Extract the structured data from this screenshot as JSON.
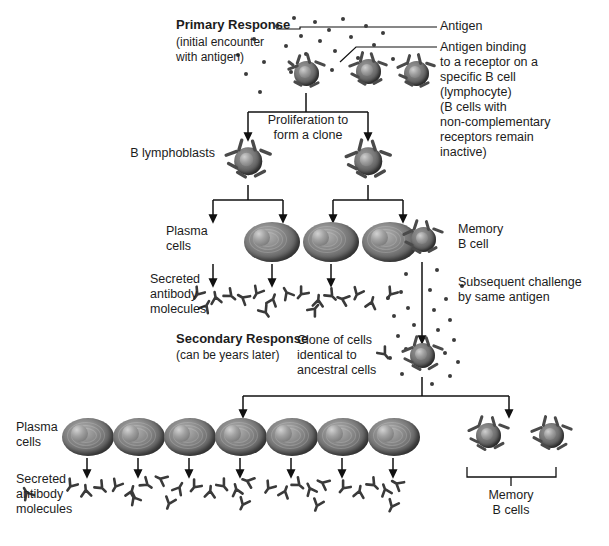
{
  "diagram": {
    "type": "biology-flow-diagram"
  },
  "labels": {
    "primary_response_title": "Primary Response",
    "primary_response_sub": "(initial encounter\nwith antigen)",
    "antigen": "Antigen",
    "antigen_binding": "Antigen binding\nto a receptor on a\nspecific B cell\n(lymphocyte)\n(B cells with\nnon-complementary\nreceptors remain\ninactive)",
    "proliferation": "Proliferation to\nform a clone",
    "b_lymphoblasts": "B lymphoblasts",
    "plasma_cells_1": "Plasma\ncells",
    "secreted_antibody_1": "Secreted\nantibody\nmolecules",
    "memory_b_cell": "Memory\nB cell",
    "subsequent_challenge": "Subsequent challenge\nby same antigen",
    "secondary_response_title": "Secondary Response",
    "secondary_response_sub": "(can be years later)",
    "clone_of_cells": "Clone of cells\nidentical to\nancestral cells",
    "plasma_cells_2": "Plasma\ncells",
    "secreted_antibody_2": "Secreted\nantibody\nmolecules",
    "memory_b_cells": "Memory\nB cells"
  },
  "counts": {
    "top_b_cells": 3,
    "b_lymphoblasts": 2,
    "primary_plasma_cells": 3,
    "primary_memory_b_cells": 1,
    "secondary_plasma_cells": 7,
    "secondary_memory_b_cells": 2
  },
  "colors": {
    "ink": "#1c1c1c",
    "cell_dark": "#4e4e4e",
    "cell_light": "#b4b4b4",
    "antigen_dot": "#3c3c3c",
    "background": "#ffffff"
  }
}
